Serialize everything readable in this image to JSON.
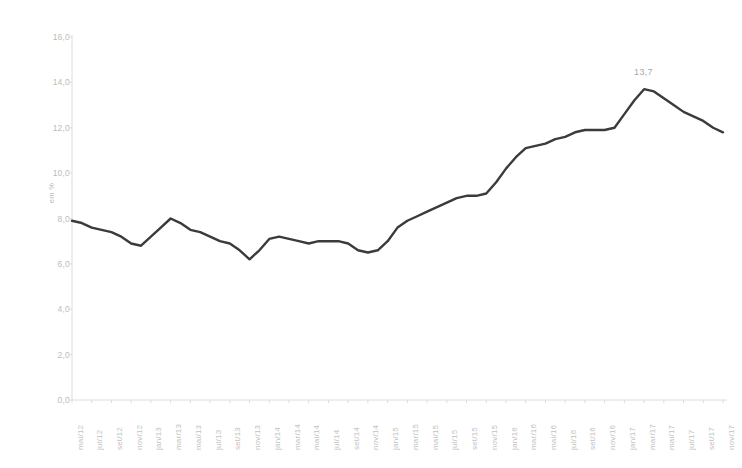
{
  "chart_data": {
    "type": "line",
    "title": "",
    "xlabel": "",
    "ylabel": "em %",
    "ylim": [
      0.0,
      16.0
    ],
    "ytick_labels": [
      "0,0",
      "2,0",
      "4,0",
      "6,0",
      "8,0",
      "10,0",
      "12,0",
      "14,0",
      "16,0"
    ],
    "ytick_values": [
      0.0,
      2.0,
      4.0,
      6.0,
      8.0,
      10.0,
      12.0,
      14.0,
      16.0
    ],
    "grid": false,
    "legend": null,
    "legend_position": "none",
    "annotations": [
      {
        "label": "13,7",
        "x": "mar/17",
        "value": 13.7
      }
    ],
    "categories": [
      "mai/12",
      "jun/12",
      "jul/12",
      "ago/12",
      "set/12",
      "out/12",
      "nov/12",
      "dez/12",
      "jan/13",
      "fev/13",
      "mar/13",
      "abr/13",
      "mai/13",
      "jun/13",
      "jul/13",
      "ago/13",
      "set/13",
      "out/13",
      "nov/13",
      "dez/13",
      "jan/14",
      "fev/14",
      "mar/14",
      "abr/14",
      "mai/14",
      "jun/14",
      "jul/14",
      "ago/14",
      "set/14",
      "out/14",
      "nov/14",
      "dez/14",
      "jan/15",
      "fev/15",
      "mar/15",
      "abr/15",
      "mai/15",
      "jun/15",
      "jul/15",
      "ago/15",
      "set/15",
      "out/15",
      "nov/15",
      "dez/15",
      "jan/16",
      "fev/16",
      "mar/16",
      "abr/16",
      "mai/16",
      "jun/16",
      "jul/16",
      "ago/16",
      "set/16",
      "out/16",
      "nov/16",
      "dez/16",
      "jan/17",
      "fev/17",
      "mar/17",
      "abr/17",
      "mai/17",
      "jun/17",
      "jul/17",
      "ago/17",
      "set/17",
      "out/17",
      "nov/17"
    ],
    "xtick_labels": [
      "mai/12",
      "jul/12",
      "set/12",
      "nov/12",
      "jan/13",
      "mar/13",
      "mai/13",
      "jul/13",
      "set/13",
      "nov/13",
      "jan/14",
      "mar/14",
      "mai/14",
      "jul/14",
      "set/14",
      "nov/14",
      "jan/15",
      "mar/15",
      "mai/15",
      "jul/15",
      "set/15",
      "nov/15",
      "jan/16",
      "mar/16",
      "mai/16",
      "jul/16",
      "set/16",
      "nov/16",
      "jan/17",
      "mar/17",
      "mai/17",
      "jul/17",
      "set/17",
      "nov/17"
    ],
    "values": [
      7.9,
      7.8,
      7.6,
      7.5,
      7.4,
      7.2,
      6.9,
      6.8,
      7.2,
      7.6,
      8.0,
      7.8,
      7.5,
      7.4,
      7.2,
      7.0,
      6.9,
      6.6,
      6.2,
      6.6,
      7.1,
      7.2,
      7.1,
      7.0,
      6.9,
      7.0,
      7.0,
      7.0,
      6.9,
      6.6,
      6.5,
      6.6,
      7.0,
      7.6,
      7.9,
      8.1,
      8.3,
      8.5,
      8.7,
      8.9,
      9.0,
      9.0,
      9.1,
      9.6,
      10.2,
      10.7,
      11.1,
      11.2,
      11.3,
      11.5,
      11.6,
      11.8,
      11.9,
      11.9,
      11.9,
      12.0,
      12.6,
      13.2,
      13.7,
      13.6,
      13.3,
      13.0,
      12.7,
      12.5,
      12.3,
      12.0,
      11.8
    ],
    "series_color": "#3b3b3b",
    "axis_color": "#dcdcdc",
    "tick_text_color": "#c2c2c2",
    "background": "#ffffff"
  }
}
